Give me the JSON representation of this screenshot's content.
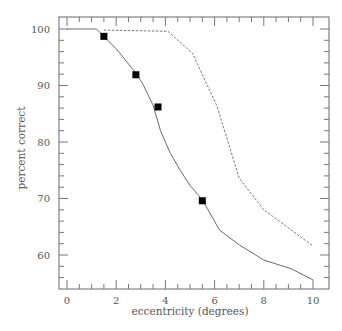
{
  "chart_data": {
    "type": "line",
    "title": "",
    "xlabel": "eccentricity (degrees)",
    "ylabel": "percent correct",
    "xlim": [
      -0.3,
      10.6
    ],
    "ylim": [
      54,
      102.3
    ],
    "x_ticks": [
      0,
      2,
      4,
      6,
      8,
      10
    ],
    "x_minor_step": 0.5,
    "y_ticks": [
      60,
      70,
      80,
      90,
      100
    ],
    "y_minor_step": 2,
    "grid": false,
    "legend": null,
    "series": [
      {
        "name": "solid curve",
        "style": "solid",
        "x": [
          0,
          1.2,
          2.0,
          2.8,
          3.1,
          3.5,
          3.8,
          4.2,
          4.6,
          5.0,
          5.5,
          6.2,
          7.0,
          8.0,
          9.1,
          10.0
        ],
        "y": [
          100,
          100,
          96.5,
          92.2,
          90.1,
          86.5,
          82.0,
          78.0,
          75.0,
          72.3,
          69.8,
          64.4,
          61.8,
          59.1,
          57.6,
          55.6
        ]
      },
      {
        "name": "dashed curve",
        "style": "dashed",
        "x": [
          1.5,
          4.1,
          5.1,
          6.1,
          7.0,
          8.0,
          10.0
        ],
        "y": [
          99.8,
          99.6,
          95.7,
          86.3,
          73.6,
          68.0,
          61.6
        ]
      },
      {
        "name": "data points",
        "style": "square-markers",
        "x": [
          1.5,
          2.8,
          3.7,
          5.5
        ],
        "y": [
          98.7,
          91.9,
          86.2,
          69.6
        ]
      }
    ]
  },
  "axes": {
    "x_tick_labels": [
      "0",
      "2",
      "4",
      "6",
      "8",
      "10"
    ],
    "y_tick_labels": [
      "60",
      "70",
      "80",
      "90",
      "100"
    ]
  }
}
